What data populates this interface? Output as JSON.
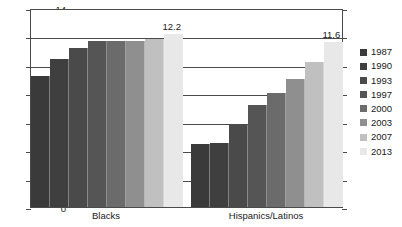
{
  "chart_data": {
    "type": "bar",
    "title": "",
    "xlabel": "",
    "ylabel": "",
    "ylim": [
      0,
      14
    ],
    "yticks": [
      0,
      2,
      4,
      6,
      8,
      10,
      12,
      14
    ],
    "grid": true,
    "legend_position": "right",
    "categories": [
      "Blacks",
      "Hispanics/Latinos"
    ],
    "series": [
      {
        "name": "1987",
        "color": "#3a3a3a",
        "values": [
          9.2,
          4.4
        ]
      },
      {
        "name": "1990",
        "color": "#3f3f3f",
        "values": [
          10.4,
          4.5
        ]
      },
      {
        "name": "1993",
        "color": "#4a4a4a",
        "values": [
          11.2,
          5.8
        ]
      },
      {
        "name": "1997",
        "color": "#555555",
        "values": [
          11.65,
          7.2
        ]
      },
      {
        "name": "2000",
        "color": "#6b6b6b",
        "values": [
          11.65,
          8.0
        ]
      },
      {
        "name": "2003",
        "color": "#8f8f8f",
        "values": [
          11.65,
          9.0
        ]
      },
      {
        "name": "2007",
        "color": "#c0c0c0",
        "values": [
          11.8,
          10.2
        ]
      },
      {
        "name": "2013",
        "color": "#e8e8e8",
        "values": [
          12.2,
          11.6
        ]
      }
    ],
    "annotations": [
      {
        "text": "12.2",
        "series": "2013",
        "category": "Blacks"
      },
      {
        "text": "11.6",
        "series": "2013",
        "category": "Hispanics/Latinos"
      }
    ]
  }
}
